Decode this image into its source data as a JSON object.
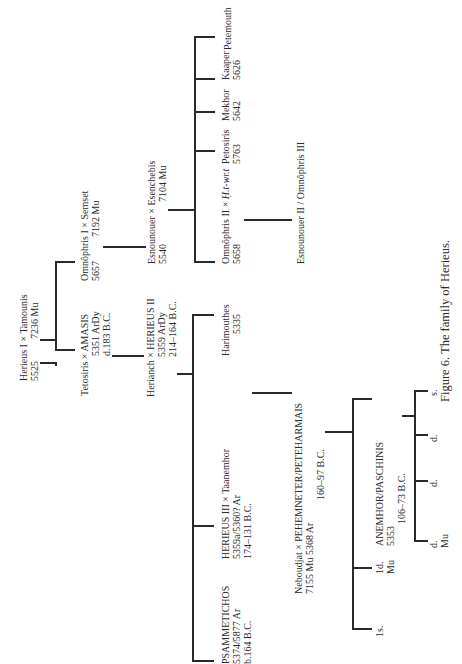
{
  "figure": {
    "caption_prefix": "Figure 6.",
    "caption_text": "The family of Herieus."
  },
  "people": {
    "herieus_i": {
      "line1": "Herieus I × Tamounis",
      "line2a": "5525",
      "line2b": "7236   Mu"
    },
    "tetosiris": {
      "line1": "Tetosiris × AMASIS",
      "line2": "5351 ArDy",
      "line3": "d.183 B.C."
    },
    "omnophris_i": {
      "line1": "Omnôphris I × Semset",
      "line2a": "5657",
      "line2b": "7192   Mu"
    },
    "esnounouer": {
      "line1": "Esnounouer × Esenchebis",
      "line2a": "5540",
      "line2b": "7104   Mu"
    },
    "omnophris_ii": {
      "line1_a": "Omnôphris II × ",
      "line1_b": "Ḥ.t-wr.t",
      "line2": "5658"
    },
    "esnounouer_ii": {
      "line1": "Esnounouer II / Omnôphris III"
    },
    "petosiris": {
      "line1": "Petosiris",
      "line2": "5763"
    },
    "mekhor": {
      "line1": "Mekhor",
      "line2": "5642"
    },
    "kaper": {
      "line1": "Kaaper",
      "line2": "5626"
    },
    "petemouth": {
      "line1": "Petemouth"
    },
    "herianch": {
      "line1": "Herianch × HERIEUS II",
      "line2": "5359   ArDy",
      "line3": "214–164 B.C."
    },
    "harimouthes": {
      "line1": "Harimouthes",
      "line2": "5335"
    },
    "herieus_iii": {
      "line1": "HERIEUS III × Taanemhor",
      "line2": "5359a/5360? Ar",
      "line3": "174–131 B.C."
    },
    "psammetichos": {
      "line1": "PSAMMETICHOS",
      "line2": "5374/5877 Ar",
      "line3": "b.164 B.C."
    },
    "neboudjat": {
      "line1": "Neboudjat × PEHEMNETER/PETEHARMAIS",
      "line2": "7155   Mu      5368   Ar",
      "line3": "160–97 B.C."
    },
    "anemhor": {
      "line1": "ANEMHOR/PASCHINIS",
      "line2": "5353",
      "line3": "106–73 B.C."
    },
    "child_1s": {
      "line1": "1s."
    },
    "child_1d": {
      "line1": "1d.",
      "line2": "Mu"
    },
    "gc_d1": {
      "line1": "d.",
      "line2": "Mu"
    },
    "gc_d2": {
      "line1": "d."
    },
    "gc_d3": {
      "line1": "d."
    },
    "gc_s": {
      "line1": "s."
    }
  }
}
